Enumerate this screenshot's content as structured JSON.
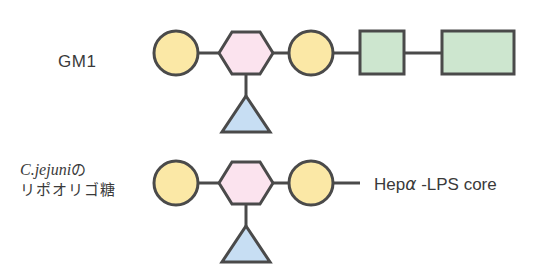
{
  "labels": {
    "gm1": "GM1",
    "cjejuni_species": "C.jejuni",
    "cjejuni_particle": "の",
    "cjejuni_line2": "リポオリゴ糖",
    "core_prefix": "Hep",
    "core_alpha": "α",
    "core_suffix": " -LPS core"
  },
  "colors": {
    "stroke": "#4a4a4a",
    "circle_fill": "#fbe8a6",
    "hexagon_fill": "#fbe3ee",
    "triangle_fill": "#c7def3",
    "square_fill": "#cde6cf",
    "text": "#3a3a3a"
  },
  "structures": [
    {
      "name": "GM1",
      "chain": [
        "circle",
        "hexagon",
        "circle",
        "square",
        "rectangle"
      ],
      "branch": {
        "on": "hexagon",
        "shape": "triangle"
      }
    },
    {
      "name": "C.jejuni lipooligosaccharide",
      "chain": [
        "circle",
        "hexagon",
        "circle",
        "line-to-core"
      ],
      "branch": {
        "on": "hexagon",
        "shape": "triangle"
      },
      "terminal_label": "Hepα -LPS core"
    }
  ]
}
